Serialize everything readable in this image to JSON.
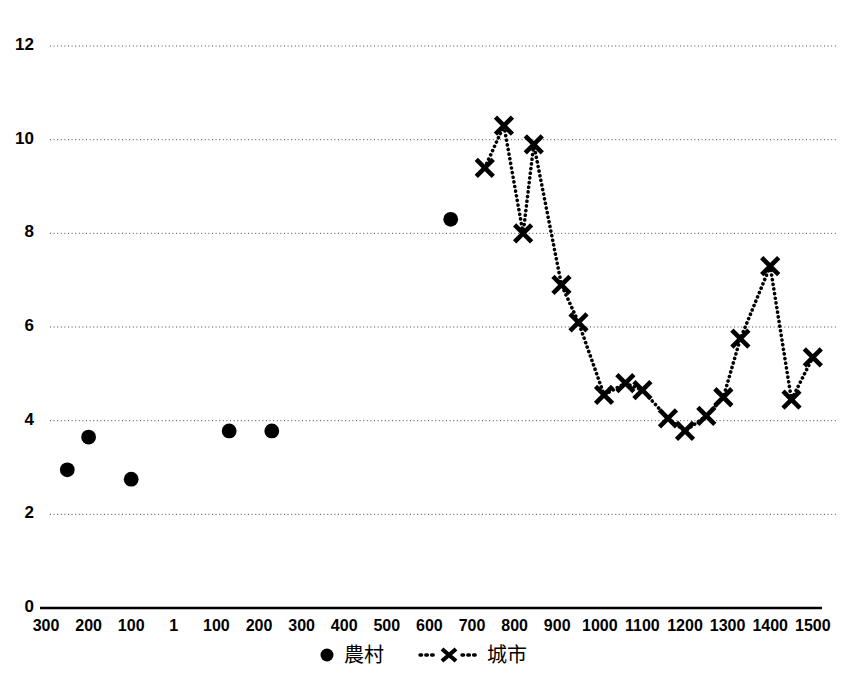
{
  "chart_data": {
    "type": "scatter",
    "title": "",
    "xlabel": "",
    "ylabel": "",
    "xlim": [
      -300,
      1500
    ],
    "ylim": [
      0,
      12
    ],
    "grid": true,
    "legend_position": "bottom-center",
    "y_ticks": [
      "0",
      "2",
      "4",
      "6",
      "8",
      "10",
      "12"
    ],
    "y_tick_values": [
      0,
      2,
      4,
      6,
      8,
      10,
      12
    ],
    "x_ticks": [
      "300",
      "200",
      "100",
      "1",
      "100",
      "200",
      "300",
      "400",
      "500",
      "600",
      "700",
      "800",
      "900",
      "1000",
      "1100",
      "1200",
      "1300",
      "1400",
      "1500"
    ],
    "x_tick_values": [
      -300,
      -200,
      -100,
      1,
      100,
      200,
      300,
      400,
      500,
      600,
      700,
      800,
      900,
      1000,
      1100,
      1200,
      1300,
      1400,
      1500
    ],
    "series": [
      {
        "name": "農村",
        "marker": "filled-circle",
        "line": "none",
        "color": "#000000",
        "points": [
          {
            "x": -250,
            "y": 2.95
          },
          {
            "x": -200,
            "y": 3.65
          },
          {
            "x": -100,
            "y": 2.75
          },
          {
            "x": 130,
            "y": 3.78
          },
          {
            "x": 230,
            "y": 3.78
          },
          {
            "x": 650,
            "y": 8.3
          }
        ]
      },
      {
        "name": "城市",
        "marker": "x-cross",
        "line": "dotted",
        "color": "#000000",
        "points": [
          {
            "x": 730,
            "y": 9.4
          },
          {
            "x": 775,
            "y": 10.3
          },
          {
            "x": 820,
            "y": 8.0
          },
          {
            "x": 845,
            "y": 9.9
          },
          {
            "x": 910,
            "y": 6.9
          },
          {
            "x": 950,
            "y": 6.1
          },
          {
            "x": 1010,
            "y": 4.55
          },
          {
            "x": 1060,
            "y": 4.8
          },
          {
            "x": 1100,
            "y": 4.65
          },
          {
            "x": 1160,
            "y": 4.05
          },
          {
            "x": 1200,
            "y": 3.78
          },
          {
            "x": 1250,
            "y": 4.1
          },
          {
            "x": 1290,
            "y": 4.5
          },
          {
            "x": 1330,
            "y": 5.75
          },
          {
            "x": 1400,
            "y": 7.3
          },
          {
            "x": 1450,
            "y": 4.45
          },
          {
            "x": 1500,
            "y": 5.35
          }
        ]
      }
    ],
    "legend": [
      {
        "label": "農村",
        "marker": "filled-circle"
      },
      {
        "label": "城市",
        "marker": "x-cross-dotted"
      }
    ]
  }
}
